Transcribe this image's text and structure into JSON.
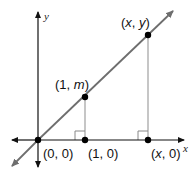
{
  "diagram": {
    "type": "coordinate-plane",
    "colors": {
      "axes": "#111111",
      "line": "#6e6e6e",
      "drop_lines": "#a8a8a8",
      "points": "#000000",
      "text": "#111111"
    },
    "axes": {
      "x_label": "x",
      "y_label": "y",
      "origin_px": [
        38,
        140
      ]
    },
    "line": {
      "description": "line through origin with slope m",
      "from_px": [
        13,
        165
      ],
      "to_px": [
        172,
        12
      ]
    },
    "points": [
      {
        "id": "origin",
        "label_pre": "(0, 0)",
        "label_parts": [
          {
            "t": "(0, 0)",
            "i": false
          }
        ],
        "px": [
          38,
          140
        ],
        "label_px": [
          43,
          158
        ]
      },
      {
        "id": "one-zero",
        "label_parts": [
          {
            "t": "(1, 0)",
            "i": false
          }
        ],
        "px": [
          85,
          140
        ],
        "label_px": [
          88,
          158
        ]
      },
      {
        "id": "x-zero",
        "label_parts": [
          {
            "t": "(",
            "i": false
          },
          {
            "t": "x",
            "i": true
          },
          {
            "t": ", 0)",
            "i": false
          }
        ],
        "px": [
          148,
          140
        ],
        "label_px": [
          151,
          158
        ]
      },
      {
        "id": "one-m",
        "label_parts": [
          {
            "t": "(1, ",
            "i": false
          },
          {
            "t": "m",
            "i": true
          },
          {
            "t": ")",
            "i": false
          }
        ],
        "px": [
          85,
          97
        ],
        "label_px": [
          55,
          89
        ]
      },
      {
        "id": "x-y",
        "label_parts": [
          {
            "t": "(",
            "i": false
          },
          {
            "t": "x",
            "i": true
          },
          {
            "t": ", ",
            "i": false
          },
          {
            "t": "y",
            "i": true
          },
          {
            "t": ")",
            "i": false
          }
        ],
        "px": [
          148,
          35
        ],
        "label_px": [
          121,
          27
        ]
      }
    ],
    "right_angles": [
      {
        "at": "one-zero",
        "box_px": [
          75,
          131,
          10,
          9
        ]
      },
      {
        "at": "x-zero",
        "box_px": [
          138,
          131,
          10,
          9
        ]
      }
    ]
  }
}
